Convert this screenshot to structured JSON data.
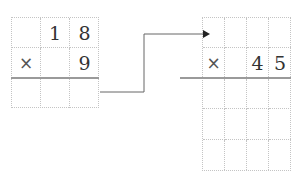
{
  "left_problem": {
    "rows": [
      [
        "",
        "1",
        "8"
      ],
      [
        "×",
        "",
        "9"
      ],
      [
        "",
        "",
        ""
      ]
    ]
  },
  "right_problem": {
    "rows": [
      [
        "",
        "",
        "",
        ""
      ],
      [
        "×",
        "",
        "4",
        "5"
      ],
      [
        "",
        "",
        "",
        ""
      ],
      [
        "",
        "",
        "",
        ""
      ],
      [
        "",
        "",
        "",
        ""
      ]
    ]
  },
  "connector": {
    "type": "arrow",
    "from": "left_problem",
    "to": "right_problem"
  }
}
